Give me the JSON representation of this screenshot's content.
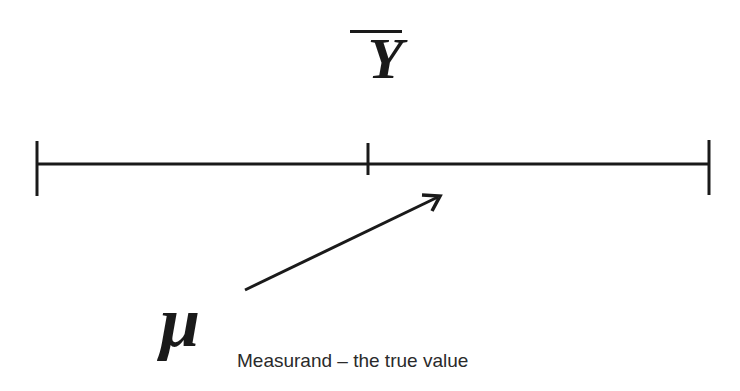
{
  "diagram": {
    "symbols": {
      "sample_mean": "Y",
      "true_value": "μ"
    },
    "caption": "Measurand – the true value",
    "number_line": {
      "left_end_x": 37,
      "right_end_x": 709,
      "mean_tick_x": 368,
      "line_y": 164
    },
    "arrow": {
      "from": [
        245,
        290
      ],
      "to": [
        440,
        196
      ],
      "label_target": "number line"
    },
    "colors": {
      "ink": "#1a1a1a",
      "background": "#ffffff"
    }
  }
}
